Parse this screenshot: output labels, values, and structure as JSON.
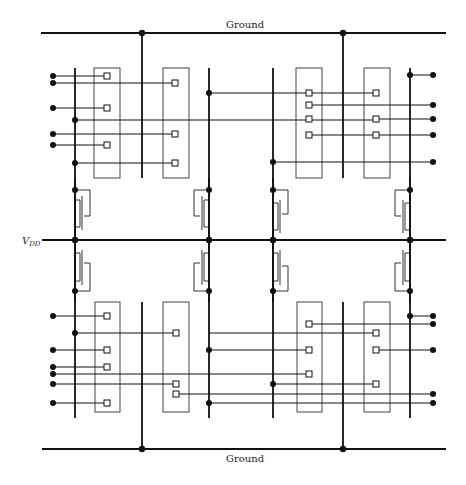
{
  "diagram": {
    "type": "circuit-layout",
    "labels": {
      "ground_top": "Ground",
      "ground_bottom": "Ground",
      "vdd": "V",
      "vdd_sub": "DD"
    },
    "colors": {
      "wire": "#111111",
      "box": "#444444",
      "background": "#ffffff"
    },
    "rails": {
      "ground_top": {
        "y": 33,
        "x1": 41,
        "x2": 446
      },
      "ground_bottom": {
        "y": 449,
        "x1": 42,
        "x2": 446
      },
      "vdd": {
        "y": 240,
        "x1": 42,
        "x2": 446
      }
    },
    "verticals": [
      {
        "x": 75,
        "y1": 68,
        "y2": 418
      },
      {
        "x": 142,
        "y1": 33,
        "y2": 178
      },
      {
        "x": 142,
        "y1": 302,
        "y2": 449
      },
      {
        "x": 209,
        "y1": 68,
        "y2": 418
      },
      {
        "x": 273,
        "y1": 68,
        "y2": 418
      },
      {
        "x": 343,
        "y1": 33,
        "y2": 178
      },
      {
        "x": 343,
        "y1": 302,
        "y2": 449
      },
      {
        "x": 410,
        "y1": 68,
        "y2": 418
      }
    ],
    "boxes_upper": [
      {
        "x": 94,
        "y": 68,
        "w": 26,
        "h": 110
      },
      {
        "x": 163,
        "y": 68,
        "w": 26,
        "h": 110
      },
      {
        "x": 296,
        "y": 68,
        "w": 26,
        "h": 110
      },
      {
        "x": 364,
        "y": 68,
        "w": 26,
        "h": 110
      }
    ],
    "boxes_lower": [
      {
        "x": 95,
        "y": 302,
        "w": 25,
        "h": 110
      },
      {
        "x": 163,
        "y": 302,
        "w": 26,
        "h": 110
      },
      {
        "x": 297,
        "y": 302,
        "w": 25,
        "h": 110
      },
      {
        "x": 364,
        "y": 302,
        "w": 26,
        "h": 110
      }
    ]
  }
}
